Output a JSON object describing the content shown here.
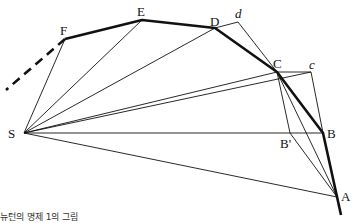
{
  "diagram": {
    "labels": {
      "S": "S",
      "F": "F",
      "E": "E",
      "D": "D",
      "d": "d",
      "C": "C",
      "c": "c",
      "B": "B",
      "B_prime": "B'",
      "A": "A"
    },
    "caption": "뉴턴의 명제 1의 그림",
    "colors": {
      "line": "#111111",
      "background": "#ffffff"
    }
  }
}
